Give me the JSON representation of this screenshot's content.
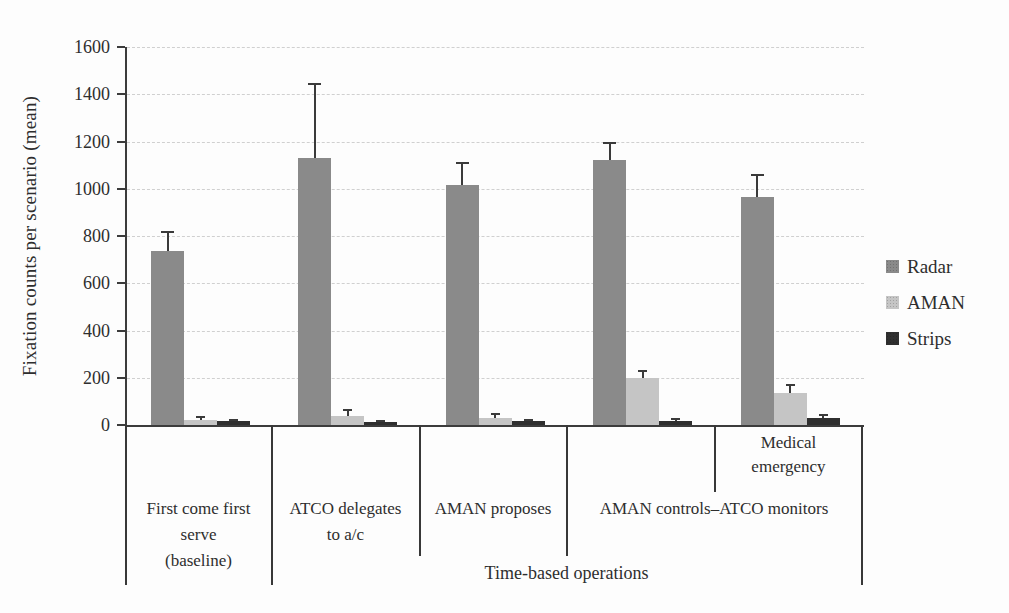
{
  "chart_data": {
    "type": "bar",
    "title": "",
    "xlabel": "",
    "ylabel": "Fixation counts per scenario (mean)",
    "ylim": [
      0,
      1600
    ],
    "ytick_step": 200,
    "yticks": [
      0,
      200,
      400,
      600,
      800,
      1000,
      1200,
      1400,
      1600
    ],
    "grid": true,
    "grid_style": "dashed-horizontal",
    "legend_position": "right-outside",
    "error_bars": "upper-whisker-with-cap",
    "categories": [
      "First come first serve (baseline)",
      "ATCO delegates to a/c",
      "AMAN proposes",
      "AMAN controls–ATCO monitors",
      "AMAN controls–ATCO monitors (Medical emergency)"
    ],
    "series": [
      {
        "name": "Radar",
        "color": "#8a8a8a",
        "values": [
          735,
          1130,
          1015,
          1120,
          965
        ],
        "error_upper": [
          80,
          315,
          95,
          75,
          95
        ]
      },
      {
        "name": "AMAN",
        "color": "#c5c5c5",
        "values": [
          20,
          40,
          28,
          200,
          135
        ],
        "error_upper": [
          15,
          22,
          20,
          30,
          35
        ]
      },
      {
        "name": "Strips",
        "color": "#2f2f2f",
        "values": [
          15,
          12,
          15,
          18,
          28
        ],
        "error_upper": [
          6,
          5,
          8,
          8,
          14
        ]
      }
    ],
    "axis_annotations": {
      "row1_sub_label": "Medical emergency",
      "row1_sub_label_applies_to": "category 5 only",
      "row2_scenario_labels": [
        "First come first serve (baseline)",
        "ATCO delegates to a/c",
        "AMAN proposes",
        "AMAN controls–ATCO monitors (spans categories 4–5)"
      ],
      "row3_super_label": "Time-based operations",
      "row3_super_label_spans": "categories 2–5"
    }
  },
  "labels": {
    "ylabel": "Fixation counts per scenario (mean)",
    "cat1": [
      "First come first",
      "serve",
      "(baseline)"
    ],
    "cat2": [
      "ATCO delegates",
      "to a/c"
    ],
    "cat3": "AMAN proposes",
    "cat4": "AMAN controls–ATCO monitors",
    "medical": [
      "Medical",
      "emergency"
    ],
    "timebased": "Time-based operations"
  },
  "legend": {
    "items": [
      {
        "label": "Radar",
        "color": "#8a8a8a"
      },
      {
        "label": "AMAN",
        "color": "#c5c5c5"
      },
      {
        "label": "Strips",
        "color": "#2f2f2f"
      }
    ]
  },
  "colors": {
    "axis": "#3c3c3c",
    "gridline": "#d0d0d0",
    "text": "#2e2e2e",
    "background": "#fdfdfd"
  }
}
